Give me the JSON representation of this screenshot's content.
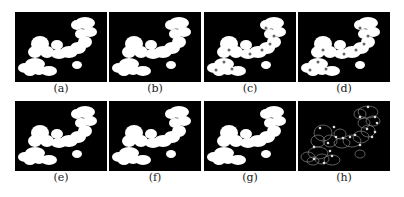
{
  "figure": {
    "panels": [
      {
        "label": "(a)",
        "kind": "segmentation-mask"
      },
      {
        "label": "(b)",
        "kind": "segmentation-mask"
      },
      {
        "label": "(c)",
        "kind": "segmentation-mask-with-marks"
      },
      {
        "label": "(d)",
        "kind": "segmentation-mask-with-marks"
      },
      {
        "label": "(e)",
        "kind": "segmentation-mask"
      },
      {
        "label": "(f)",
        "kind": "segmentation-mask"
      },
      {
        "label": "(g)",
        "kind": "segmentation-mask"
      },
      {
        "label": "(h)",
        "kind": "contour-with-points"
      }
    ],
    "colors": {
      "background": "#000000",
      "foreground": "#ffffff",
      "contour": "#9a9a9a",
      "page": "#ffffff"
    }
  }
}
